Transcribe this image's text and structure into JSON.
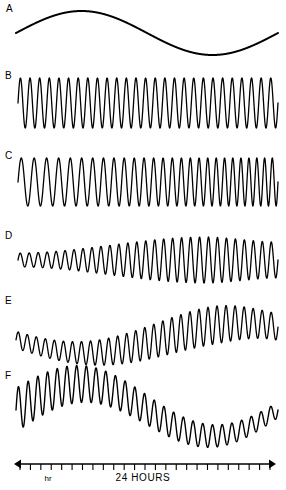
{
  "figure": {
    "background_color": "#ffffff",
    "stroke_color": "#000000",
    "width": 286,
    "height": 490
  },
  "axis": {
    "label": "24 HOURS",
    "minor_label": "hr",
    "x_start": 14,
    "x_end": 276,
    "y": 464,
    "tick_count": 24,
    "tick_length": 6,
    "arrows": "both",
    "label_x": 143,
    "label_y": 481,
    "minor_label_x": 48,
    "minor_label_y": 481
  },
  "chart_data": {
    "type": "line",
    "title": "",
    "xlabel": "24 HOURS",
    "ylabel": "",
    "grid": false,
    "legend": "none",
    "x_range": [
      0,
      24
    ],
    "x_unit": "hours",
    "series": [
      {
        "name": "A",
        "label": "A",
        "label_x": 6,
        "label_y": 12,
        "baseline_y": 33,
        "x_start": 16,
        "x_end": 278,
        "stroke_width": 2.0,
        "slow_cycles": 1.0,
        "slow_amplitude": 22,
        "slow_phase": 0.0,
        "fast_cycles": 0,
        "fast_amplitude": 0,
        "fast_chirp": 0,
        "fast_env_start": 0,
        "fast_env_end": 0,
        "fast_env_peak": 0.5
      },
      {
        "name": "B",
        "label": "B",
        "label_x": 5,
        "label_y": 79,
        "baseline_y": 103,
        "x_start": 18,
        "x_end": 278,
        "stroke_width": 1.3,
        "slow_cycles": 0,
        "slow_amplitude": 0,
        "slow_phase": 0.0,
        "fast_cycles": 27,
        "fast_amplitude": 25,
        "fast_chirp": 0.0,
        "fast_env_start": 1.0,
        "fast_env_end": 1.0,
        "fast_env_peak": 0.5
      },
      {
        "name": "C",
        "label": "C",
        "label_x": 5,
        "label_y": 159,
        "baseline_y": 182,
        "x_start": 18,
        "x_end": 278,
        "stroke_width": 1.3,
        "slow_cycles": 0,
        "slow_amplitude": 0,
        "slow_phase": 0.0,
        "fast_cycles": 27,
        "fast_amplitude": 24,
        "fast_chirp": 0.75,
        "fast_env_start": 1.0,
        "fast_env_end": 1.0,
        "fast_env_peak": 0.5
      },
      {
        "name": "D",
        "label": "D",
        "label_x": 5,
        "label_y": 239,
        "baseline_y": 260,
        "x_start": 18,
        "x_end": 278,
        "stroke_width": 1.3,
        "slow_cycles": 0,
        "slow_amplitude": 0,
        "slow_phase": 0.0,
        "fast_cycles": 29,
        "fast_amplitude": 23,
        "fast_chirp": 0.0,
        "fast_env_start": 0.3,
        "fast_env_end": 0.78,
        "fast_env_peak": 0.72
      },
      {
        "name": "E",
        "label": "E",
        "label_x": 5,
        "label_y": 304,
        "baseline_y": 338,
        "x_start": 16,
        "x_end": 278,
        "stroke_width": 1.3,
        "slow_cycles": 0.85,
        "slow_amplitude": 15,
        "slow_phase": 0.52,
        "fast_cycles": 29,
        "fast_amplitude": 19,
        "fast_chirp": 0.0,
        "fast_env_start": 0.45,
        "fast_env_end": 0.7,
        "fast_env_peak": 0.74
      },
      {
        "name": "F",
        "label": "F",
        "label_x": 5,
        "label_y": 379,
        "baseline_y": 410,
        "x_start": 16,
        "x_end": 278,
        "stroke_width": 1.4,
        "slow_cycles": 1.0,
        "slow_amplitude": 26,
        "slow_phase": 0.0,
        "fast_cycles": 27,
        "fast_amplitude": 22,
        "fast_chirp": 0.0,
        "fast_env_start": 1.0,
        "fast_env_end": 0.35,
        "fast_env_peak": 0.0
      }
    ]
  }
}
